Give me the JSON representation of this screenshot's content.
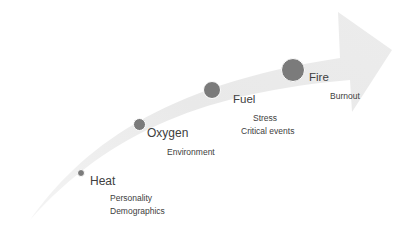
{
  "diagram": {
    "type": "curved-progression-arrow",
    "colors": {
      "arrow_fill": "#ebebeb",
      "dot_fill": "#7b7b7b",
      "text": "#404040"
    },
    "stages": [
      {
        "label": "Heat",
        "details": [
          "Personality",
          "Demographics"
        ]
      },
      {
        "label": "Oxygen",
        "details": [
          "Environment"
        ]
      },
      {
        "label": "Fuel",
        "details": [
          "Stress",
          "Critical events"
        ]
      },
      {
        "label": "Fire",
        "details": [
          "Burnout"
        ]
      }
    ]
  }
}
